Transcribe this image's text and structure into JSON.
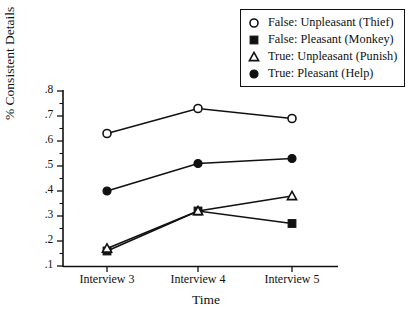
{
  "chart_data": {
    "type": "line",
    "title": "",
    "xlabel": "Time",
    "ylabel": "% Consistent Details",
    "categories": [
      "Interview 3",
      "Interview 4",
      "Interview 5"
    ],
    "ylim": [
      0.1,
      0.8
    ],
    "ytick_labels": [
      ".8",
      ".7",
      ".6",
      ".5",
      ".4",
      ".3",
      ".2",
      ".1"
    ],
    "ytick_values": [
      0.8,
      0.7,
      0.6,
      0.5,
      0.4,
      0.3,
      0.2,
      0.1
    ],
    "grid": false,
    "legend_position": "top-right",
    "series": [
      {
        "name": "False: Unpleasant (Thief)",
        "marker": "open-circle",
        "values": [
          0.63,
          0.73,
          0.69
        ]
      },
      {
        "name": "False: Pleasant (Monkey)",
        "marker": "filled-square",
        "values": [
          0.16,
          0.32,
          0.27
        ]
      },
      {
        "name": "True: Unpleasant (Punish)",
        "marker": "open-triangle",
        "values": [
          0.17,
          0.32,
          0.38
        ]
      },
      {
        "name": "True: Pleasant (Help)",
        "marker": "filled-circle",
        "values": [
          0.4,
          0.51,
          0.53
        ]
      }
    ]
  },
  "legend": {
    "items": [
      {
        "label": "False: Unpleasant (Thief)",
        "marker": "open-circle"
      },
      {
        "label": "False: Pleasant (Monkey)",
        "marker": "filled-square"
      },
      {
        "label": "True: Unpleasant (Punish)",
        "marker": "open-triangle"
      },
      {
        "label": "True: Pleasant (Help)",
        "marker": "filled-circle"
      }
    ]
  }
}
